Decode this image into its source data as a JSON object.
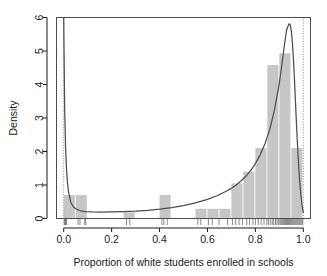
{
  "chart_data": {
    "type": "bar",
    "title": "",
    "subtitle": "",
    "xlabel": "Proportion of white students enrolled in schools",
    "ylabel": "Density",
    "xlim": [
      -0.03,
      1.03
    ],
    "ylim": [
      0,
      6
    ],
    "xticks": [
      0.0,
      0.2,
      0.4,
      0.6,
      0.8,
      1.0
    ],
    "xticklabels": [
      "0.0",
      "0.2",
      "0.4",
      "0.6",
      "0.8",
      "1.0"
    ],
    "yticks": [
      0,
      1,
      2,
      3,
      4,
      5,
      6
    ],
    "yticklabels": [
      "0",
      "1",
      "2",
      "3",
      "4",
      "5",
      "6"
    ],
    "grid": false,
    "legend": null,
    "bin_width": 0.05,
    "bar_color": "#c6c6c6",
    "curve_color": "#4d4d4d",
    "rug_color": "#7a7a7a",
    "reference_line_color": "#8c8c8c",
    "reference_lines_x": [
      0.0,
      1.0
    ],
    "series": [
      {
        "name": "Histogram density",
        "type": "bar",
        "bin_starts": [
          0.0,
          0.05,
          0.1,
          0.15,
          0.2,
          0.25,
          0.3,
          0.35,
          0.4,
          0.45,
          0.5,
          0.55,
          0.6,
          0.65,
          0.7,
          0.75,
          0.8,
          0.85,
          0.9,
          0.95
        ],
        "bin_ends": [
          0.05,
          0.1,
          0.15,
          0.2,
          0.25,
          0.3,
          0.35,
          0.4,
          0.45,
          0.5,
          0.55,
          0.6,
          0.65,
          0.7,
          0.75,
          0.8,
          0.85,
          0.9,
          0.95,
          1.0
        ],
        "values": [
          0.7,
          0.7,
          0.0,
          0.0,
          0.0,
          0.18,
          0.0,
          0.0,
          0.7,
          0.0,
          0.0,
          0.29,
          0.29,
          0.29,
          1.05,
          1.4,
          2.1,
          4.58,
          4.93,
          2.1
        ]
      },
      {
        "name": "Density curve",
        "type": "line",
        "x": [
          0.0,
          0.004,
          0.008,
          0.012,
          0.016,
          0.02,
          0.03,
          0.04,
          0.05,
          0.07,
          0.09,
          0.12,
          0.15,
          0.2,
          0.25,
          0.3,
          0.35,
          0.4,
          0.45,
          0.5,
          0.55,
          0.6,
          0.64,
          0.68,
          0.7,
          0.72,
          0.74,
          0.76,
          0.78,
          0.8,
          0.82,
          0.84,
          0.86,
          0.88,
          0.9,
          0.91,
          0.92,
          0.93,
          0.94,
          0.945,
          0.95,
          0.955,
          0.96,
          0.965,
          0.97,
          0.975,
          0.98,
          0.985,
          0.99,
          0.995,
          1.0
        ],
        "y": [
          6.0,
          3.3,
          2.1,
          1.45,
          1.05,
          0.8,
          0.47,
          0.35,
          0.29,
          0.23,
          0.205,
          0.195,
          0.19,
          0.195,
          0.205,
          0.22,
          0.245,
          0.28,
          0.325,
          0.385,
          0.465,
          0.57,
          0.68,
          0.82,
          0.9,
          1.0,
          1.12,
          1.26,
          1.43,
          1.64,
          1.9,
          2.23,
          2.66,
          3.25,
          4.05,
          4.56,
          5.12,
          5.62,
          5.81,
          5.79,
          5.6,
          5.2,
          4.6,
          3.85,
          3.05,
          2.3,
          1.64,
          1.1,
          0.68,
          0.38,
          0.18
        ]
      },
      {
        "name": "Rug marks",
        "type": "rug",
        "x": [
          0.002,
          0.004,
          0.006,
          0.008,
          0.01,
          0.012,
          0.06,
          0.068,
          0.088,
          0.092,
          0.262,
          0.276,
          0.41,
          0.418,
          0.432,
          0.56,
          0.572,
          0.604,
          0.62,
          0.648,
          0.684,
          0.704,
          0.718,
          0.732,
          0.746,
          0.764,
          0.776,
          0.79,
          0.8,
          0.812,
          0.824,
          0.836,
          0.848,
          0.854,
          0.862,
          0.87,
          0.876,
          0.884,
          0.89,
          0.896,
          0.902,
          0.906,
          0.91,
          0.914,
          0.918,
          0.922,
          0.926,
          0.93,
          0.934,
          0.938,
          0.942,
          0.946,
          0.95,
          0.954,
          0.958,
          0.962,
          0.966,
          0.97,
          0.974,
          0.978,
          0.982,
          0.986,
          0.99,
          0.994,
          0.998
        ]
      }
    ]
  },
  "axes": {
    "x_title": "Proportion of white students enrolled in schools",
    "y_title": "Density"
  }
}
